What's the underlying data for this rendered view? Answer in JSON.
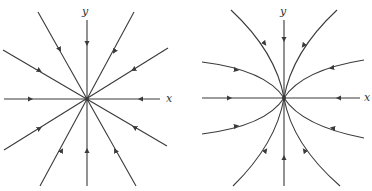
{
  "figure": {
    "panels": [
      {
        "id": "left",
        "description": "Star node (proper node): all trajectories are straight lines entering the origin",
        "x_label": "x",
        "y_label": "y",
        "stability": "stable",
        "trajectory_count": 12
      },
      {
        "id": "right",
        "description": "Improper node: trajectories are curves tangent to the y-axis entering the origin",
        "x_label": "x",
        "y_label": "y",
        "stability": "stable",
        "trajectory_count": 12
      }
    ],
    "colors": {
      "stroke": "#3a3a3a",
      "background": "#ffffff"
    }
  }
}
